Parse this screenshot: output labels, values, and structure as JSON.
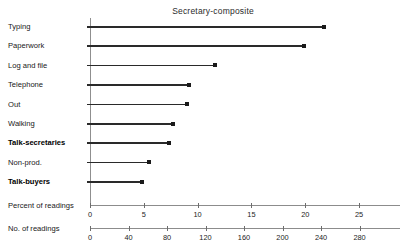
{
  "chart_data": {
    "type": "bar",
    "title": "Secretary-composite",
    "subtitle": "",
    "xlabel": "Percent of readings",
    "ylabel": "",
    "orientation": "horizontal",
    "style": "lollipop",
    "grid": false,
    "legend": null,
    "categories": [
      "Typing",
      "Paperwork",
      "Log and file",
      "Telephone",
      "Out",
      "Walking",
      "Talk-secretaries",
      "Non-prod.",
      "Talk-buyers"
    ],
    "emphasized_categories": [
      "Talk-secretaries",
      "Talk-buyers"
    ],
    "values": [
      21.7,
      19.9,
      11.6,
      9.2,
      9.0,
      7.7,
      7.3,
      5.5,
      4.8
    ],
    "value_unit": "percent",
    "xlim": [
      0,
      28.8
    ],
    "axes": [
      {
        "name": "percent-axis",
        "caption": "Percent of readings",
        "ticks": [
          0,
          5,
          10,
          15,
          20,
          25
        ],
        "tick_labels": [
          "0",
          "5",
          "10",
          "15",
          "20",
          "25"
        ],
        "min": 0,
        "max": 28.8
      },
      {
        "name": "readings-axis",
        "caption": "No. of readings",
        "ticks": [
          0,
          40,
          80,
          120,
          160,
          200,
          240,
          280
        ],
        "tick_labels": [
          "0",
          "40",
          "80",
          "120",
          "160",
          "200",
          "240",
          "280"
        ],
        "min": 0,
        "max": 322
      }
    ],
    "series": [
      {
        "name": "Secretary-composite",
        "values": [
          21.7,
          19.9,
          11.6,
          9.2,
          9.0,
          7.7,
          7.3,
          5.5,
          4.8
        ]
      }
    ]
  },
  "colors": {
    "stem": "#2a2a2a",
    "marker": "#1a1a1a",
    "axis": "#8c8c8c",
    "text": "#202020",
    "background": "#ffffff"
  }
}
